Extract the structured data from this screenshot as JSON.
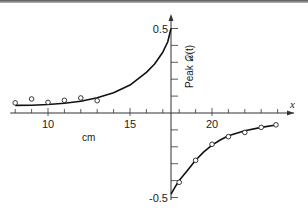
{
  "chart_data": {
    "type": "scatter",
    "title": "",
    "xlabel": "x",
    "xunit_label": "cm",
    "ylabel": "Peak 𝒟(t)",
    "xlim": [
      7.7,
      24.6
    ],
    "ylim": [
      -0.55,
      0.55
    ],
    "y_axis_at_x": 17.5,
    "x_ticks": [
      8,
      9,
      10,
      11,
      12,
      13,
      14,
      15,
      16,
      17,
      18,
      19,
      20,
      21,
      22,
      23,
      24
    ],
    "x_tick_labels": [
      {
        "value": 10,
        "label": "10"
      },
      {
        "value": 15,
        "label": "15"
      },
      {
        "value": 20,
        "label": "20"
      }
    ],
    "y_ticks": [
      -0.5,
      -0.4,
      -0.3,
      -0.2,
      -0.1,
      0.1,
      0.2,
      0.3,
      0.4,
      0.5
    ],
    "y_tick_labels": [
      {
        "value": 0.5,
        "label": "0.5"
      },
      {
        "value": -0.5,
        "label": "-0.5"
      }
    ],
    "grid": false,
    "legend": "none",
    "series": [
      {
        "name": "measured-left",
        "marker": "open-circle",
        "x": [
          8,
          9,
          10,
          11,
          12,
          13
        ],
        "y": [
          0.06,
          0.083,
          0.063,
          0.075,
          0.089,
          0.073
        ]
      },
      {
        "name": "measured-right",
        "marker": "open-circle",
        "x": [
          18,
          19,
          20,
          21,
          22,
          23,
          23.9
        ],
        "y": [
          -0.41,
          -0.28,
          -0.185,
          -0.14,
          -0.115,
          -0.085,
          -0.07
        ]
      },
      {
        "name": "theory-left",
        "type": "line",
        "x": [
          8,
          9,
          10,
          11,
          12,
          13,
          14,
          15,
          16,
          16.5,
          17,
          17.3,
          17.5
        ],
        "y": [
          0.045,
          0.046,
          0.05,
          0.058,
          0.07,
          0.09,
          0.12,
          0.165,
          0.24,
          0.29,
          0.36,
          0.42,
          0.5
        ]
      },
      {
        "name": "theory-right",
        "type": "line",
        "x": [
          17.5,
          17.8,
          18,
          18.5,
          19,
          19.5,
          20,
          20.5,
          21,
          22,
          23,
          24
        ],
        "y": [
          -0.48,
          -0.43,
          -0.4,
          -0.34,
          -0.28,
          -0.23,
          -0.19,
          -0.16,
          -0.135,
          -0.105,
          -0.085,
          -0.07
        ]
      }
    ]
  }
}
